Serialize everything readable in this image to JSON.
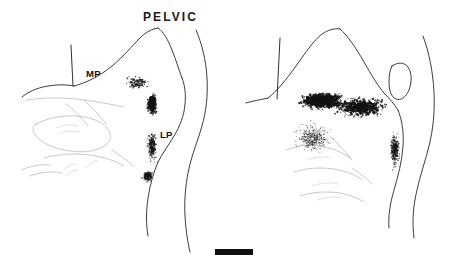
{
  "figure": {
    "type": "camera-lucida-line-drawing",
    "background_color": "#ffffff",
    "ink_color": "#1a1a1a",
    "panel_count": 2
  },
  "panels": [
    {
      "id": "pelvic",
      "title": "PELVIC",
      "labels": [
        {
          "id": "mp",
          "text": "MP"
        },
        {
          "id": "lp",
          "text": "LP"
        }
      ]
    },
    {
      "id": "pudendal",
      "title": "PUDENDAL",
      "labels": [
        {
          "id": "mp",
          "text": "MP"
        },
        {
          "id": "lp",
          "text": "LP"
        }
      ]
    }
  ],
  "scale_bar": {
    "name": "scale-bar",
    "color": "#101010"
  },
  "chart_data": {
    "type": "scatter",
    "title": "",
    "xlabel": "",
    "ylabel": "",
    "grid": false,
    "legend": "none",
    "series": [
      {
        "name": "PELVIC",
        "annotations": [
          "MP",
          "LP"
        ],
        "terminal_fields": [
          {
            "region": "MP",
            "full_name": "medial-pathway lateral collateral band (dorsal)",
            "center_x": 138,
            "center_y": 83,
            "width": 42,
            "height": 22,
            "density": "moderate",
            "point_count": 150
          },
          {
            "region": "lateral-dense-band",
            "full_name": "dorsolateral dense focus",
            "center_x": 152,
            "center_y": 104,
            "width": 17,
            "height": 36,
            "density": "high",
            "point_count": 320
          },
          {
            "region": "LP",
            "full_name": "lateral-pathway collateral band (ventral)",
            "center_x": 152,
            "center_y": 146,
            "width": 16,
            "height": 50,
            "density": "moderate",
            "point_count": 260
          },
          {
            "region": "sacral-parasympathetic-nucleus",
            "full_name": "ventral terminal focus",
            "center_x": 148,
            "center_y": 176,
            "width": 18,
            "height": 20,
            "density": "moderate-high",
            "point_count": 120
          }
        ]
      },
      {
        "name": "PUDENDAL",
        "annotations": [
          "MP",
          "LP"
        ],
        "terminal_fields": [
          {
            "region": "MP",
            "full_name": "medial dorsal horn dense band",
            "center_x": 322,
            "center_y": 101,
            "width": 72,
            "height": 26,
            "density": "very-high",
            "point_count": 900
          },
          {
            "region": "central-band",
            "full_name": "mid dorsal horn band",
            "center_x": 360,
            "center_y": 107,
            "width": 80,
            "height": 30,
            "density": "high",
            "point_count": 700
          },
          {
            "region": "diffuse-ventromedial",
            "full_name": "diffuse ventromedial spread",
            "center_x": 313,
            "center_y": 138,
            "width": 62,
            "height": 52,
            "density": "low-moderate",
            "point_count": 420
          },
          {
            "region": "LP",
            "full_name": "lateral collateral pathway band",
            "center_x": 395,
            "center_y": 150,
            "width": 16,
            "height": 62,
            "density": "moderate",
            "point_count": 300
          }
        ]
      }
    ]
  }
}
